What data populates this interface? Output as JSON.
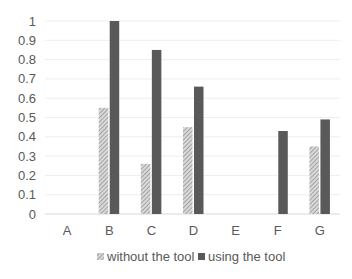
{
  "chart_data": {
    "type": "bar",
    "title": "",
    "xlabel": "",
    "ylabel": "",
    "categories": [
      "A",
      "B",
      "C",
      "D",
      "E",
      "F",
      "G"
    ],
    "series": [
      {
        "name": "without the tool",
        "style": "hatched",
        "color": "#a6a6a6",
        "values": [
          0,
          0.55,
          0.26,
          0.45,
          0,
          0,
          0.35
        ]
      },
      {
        "name": "using the tool",
        "style": "solid",
        "color": "#595959",
        "values": [
          0,
          1.0,
          0.85,
          0.66,
          0,
          0.43,
          0.49
        ]
      }
    ],
    "ylim": [
      0,
      1
    ],
    "yticks": [
      "0",
      "0.1",
      "0.2",
      "0.3",
      "0.4",
      "0.5",
      "0.6",
      "0.7",
      "0.8",
      "0.9",
      "1"
    ],
    "grid": true,
    "legend_position": "bottom"
  },
  "legend": {
    "items": [
      {
        "label": "without the tool"
      },
      {
        "label": "using the tool"
      }
    ]
  }
}
